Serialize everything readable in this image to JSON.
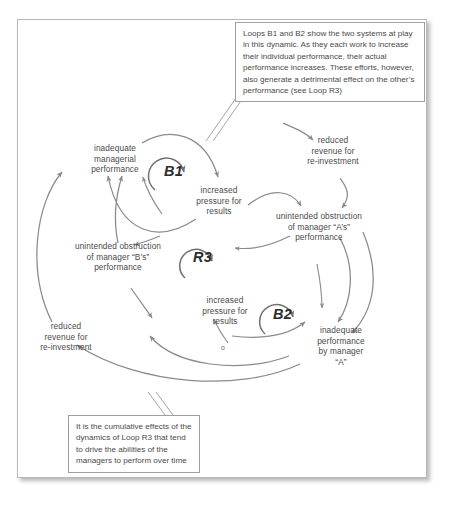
{
  "diagram": {
    "loops": [
      {
        "id": "b1",
        "label": "B1"
      },
      {
        "id": "r3",
        "label": "R3"
      },
      {
        "id": "b2",
        "label": "B2"
      }
    ],
    "nodes": [
      {
        "id": "inadequate-managerial-performance",
        "label": "inadequate\nmanagerial\nperformance"
      },
      {
        "id": "reduced-revenue-top",
        "label": "reduced\nrevenue for\nre-investment"
      },
      {
        "id": "increased-pressure-top",
        "label": "increased\npressure for\nresults"
      },
      {
        "id": "unintended-obstruction-a",
        "label": "unintended obstruction\nof manager “A’s”\nperformance"
      },
      {
        "id": "unintended-obstruction-b",
        "label": "unintended obstruction\nof manager “B’s”\nperformance"
      },
      {
        "id": "reduced-revenue-bottom",
        "label": "reduced\nrevenue for\nre-investment"
      },
      {
        "id": "increased-pressure-bottom",
        "label": "increased\npressure for\nresults"
      },
      {
        "id": "inadequate-performance-a",
        "label": "inadequate\nperformance\nby manager\n“A”"
      }
    ],
    "polarity_marks": [
      {
        "id": "polarity-o",
        "label": "o"
      }
    ],
    "callouts": [
      {
        "id": "callout-top",
        "text": "Loops B1 and B2 show the two systems at play in this dynamic. As they each work to increase their individual performance, their actual performance increases. These efforts, however, also generate a detrimental effect on the other’s performance (see Loop R3)"
      },
      {
        "id": "callout-bottom",
        "text": "It is the cumulative effects of the dynamics of Loop R3 that tend to drive the abilities of the managers to perform over time"
      }
    ],
    "colors": {
      "arrow": "#8a8a8a",
      "text": "#4a4a4a",
      "loop_label": "#2b2b2b",
      "frame_border": "#b9b9b9",
      "callout_border": "#9f9f9f",
      "background": "#ffffff"
    }
  }
}
